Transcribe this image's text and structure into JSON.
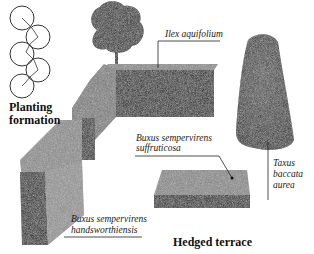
{
  "diagram": {
    "title": "Hedged terrace",
    "planting": {
      "heading_line1": "Planting",
      "heading_line2": "formation"
    },
    "labels": {
      "ilex": "Ilex aquifolium",
      "buxus_suff_line1": "Buxus sempervirens",
      "buxus_suff_line2": "suffruticosa",
      "taxus_line1": "Taxus",
      "taxus_line2": "baccata",
      "taxus_line3": "aurea",
      "buxus_hands_line1": "Buxus sempervirens",
      "buxus_hands_line2": "handsworthiensis"
    },
    "colors": {
      "background": "#ffffff",
      "ink": "#1a1a1a",
      "hedge_dark": "#2b2b2b",
      "hedge_mid": "#6e6e6e",
      "hedge_light": "#9a9a9a"
    }
  }
}
